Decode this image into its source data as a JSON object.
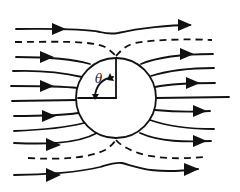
{
  "figure": {
    "angle_label": "θ",
    "colors": {
      "stroke": "#111111",
      "background": "#ffffff"
    },
    "streamlines": {
      "left_count": 9,
      "right_count": 9,
      "dividing_streamlines": 2,
      "arrowed_lines": [
        "top-outer",
        "upper-1",
        "upper-3",
        "lower-1",
        "lower-3",
        "bottom-outer"
      ]
    }
  }
}
